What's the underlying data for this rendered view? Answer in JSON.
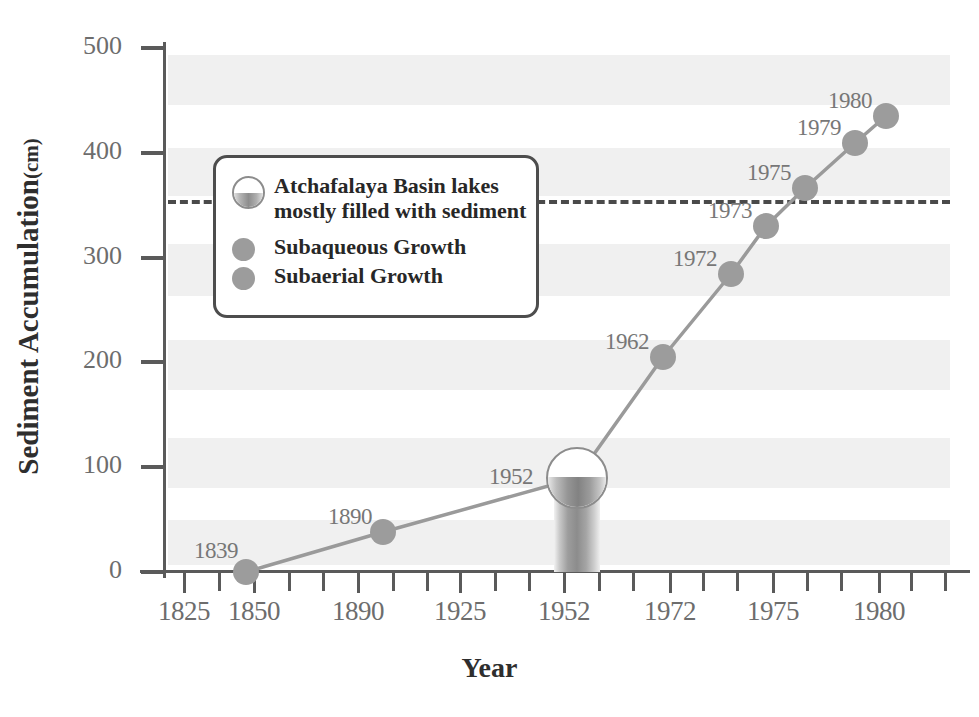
{
  "chart_data": {
    "type": "line",
    "title": "",
    "xlabel": "Year",
    "ylabel": "Sediment Accumulation",
    "ylabel_unit": "(cm)",
    "ylim": [
      0,
      500
    ],
    "yticks": [
      0,
      100,
      200,
      300,
      400,
      500
    ],
    "ytick_labels": [
      "0",
      "100",
      "200",
      "300",
      "400",
      "500"
    ],
    "xtick_labels": [
      "1825",
      "1850",
      "1890",
      "1925",
      "1952",
      "1972",
      "1975",
      "1980"
    ],
    "grid": "alternating horizontal gray bands",
    "legend_position": "upper-left inside plot",
    "x": [
      1839,
      1890,
      1952,
      1962,
      1972,
      1973,
      1975,
      1979,
      1980
    ],
    "values": [
      0,
      38,
      90,
      208,
      288,
      338,
      372,
      417,
      442
    ],
    "point_labels": [
      "1839",
      "1890",
      "1952",
      "1962",
      "1972",
      "1973",
      "1975",
      "1979",
      "1980"
    ],
    "annotations": [
      {
        "name": "threshold-line",
        "label": "Atchafalaya Basin lakes mostly filled with sediment",
        "value": 355,
        "style": "dashed horizontal line"
      },
      {
        "name": "sediment-core-1952",
        "label": "1952",
        "value": 90,
        "style": "core column with half-filled circle"
      }
    ],
    "series": [
      {
        "name": "Subaqueous Growth",
        "color": "#9c9c9c",
        "values": [
          0,
          38,
          90,
          208,
          288,
          338,
          372,
          417,
          442
        ]
      }
    ]
  },
  "axes": {
    "y_title_main": "Sediment Accumulation",
    "y_title_unit": "(cm)",
    "x_title": "Year",
    "y_ticks": [
      {
        "label": "500",
        "value": 500
      },
      {
        "label": "400",
        "value": 400
      },
      {
        "label": "300",
        "value": 300
      },
      {
        "label": "200",
        "value": 200
      },
      {
        "label": "100",
        "value": 100
      },
      {
        "label": "0",
        "value": 0
      }
    ],
    "x_ticks": [
      {
        "label": "1825",
        "px": 183
      },
      {
        "label": "1850",
        "px": 253
      },
      {
        "label": "1890",
        "px": 357
      },
      {
        "label": "1925",
        "px": 459
      },
      {
        "label": "1952",
        "px": 563
      },
      {
        "label": "1972",
        "px": 669
      },
      {
        "label": "1975",
        "px": 772
      },
      {
        "label": "1980",
        "px": 878
      }
    ],
    "x_minor_ticks_px": [
      218,
      288,
      322,
      392,
      426,
      494,
      528,
      598,
      632,
      702,
      736,
      806,
      840,
      910,
      944
    ]
  },
  "points": [
    {
      "label": "1839",
      "value": 0,
      "px": 246,
      "py": 572,
      "label_dx": -52,
      "label_dy": -34,
      "kind": "dot"
    },
    {
      "label": "1890",
      "value": 38,
      "px": 383,
      "py": 532,
      "label_dx": -55,
      "label_dy": -28,
      "kind": "dot"
    },
    {
      "label": "1952",
      "value": 90,
      "px": 577,
      "py": 478,
      "label_dx": -88,
      "label_dy": -14,
      "kind": "core"
    },
    {
      "label": "1962",
      "value": 208,
      "px": 663,
      "py": 357,
      "label_dx": -58,
      "label_dy": -28,
      "kind": "dot"
    },
    {
      "label": "1972",
      "value": 288,
      "px": 731,
      "py": 274,
      "label_dx": -58,
      "label_dy": -28,
      "kind": "dot"
    },
    {
      "label": "1973",
      "value": 338,
      "px": 766,
      "py": 226,
      "label_dx": -58,
      "label_dy": -28,
      "kind": "dot"
    },
    {
      "label": "1975",
      "value": 372,
      "px": 805,
      "py": 188,
      "label_dx": -58,
      "label_dy": -28,
      "kind": "dot"
    },
    {
      "label": "1979",
      "value": 417,
      "px": 855,
      "py": 143,
      "label_dx": -58,
      "label_dy": -28,
      "kind": "dot"
    },
    {
      "label": "1980",
      "value": 442,
      "px": 886,
      "py": 116,
      "label_dx": -58,
      "label_dy": -28,
      "kind": "dot"
    }
  ],
  "bands": [
    {
      "top": 55,
      "height": 50
    },
    {
      "top": 148,
      "height": 48
    },
    {
      "top": 244,
      "height": 52
    },
    {
      "top": 340,
      "height": 50
    },
    {
      "top": 438,
      "height": 50
    },
    {
      "top": 520,
      "height": 45
    }
  ],
  "threshold": {
    "value": 355,
    "left": 168,
    "right": 950,
    "top": 200,
    "color": "#4a4a4a"
  },
  "legend": {
    "items": [
      {
        "icon": "sediment-core-icon",
        "label_line1": "Atchafalaya Basin lakes",
        "label_line2": "mostly filled with sediment"
      },
      {
        "icon": "gray-dot-icon",
        "label_line1": "Subaqueous Growth",
        "label_line2": ""
      },
      {
        "icon": "gray-dot-icon",
        "label_line1": "Subaerial Growth",
        "label_line2": ""
      }
    ]
  },
  "colors": {
    "marker": "#9c9c9c",
    "line": "#9a9a9a",
    "axis": "#5a5a5a",
    "band": "#f0f0f0",
    "tick_label": "#6d6d6d",
    "title": "#2e2e2e",
    "dash": "#4a4a4a"
  }
}
